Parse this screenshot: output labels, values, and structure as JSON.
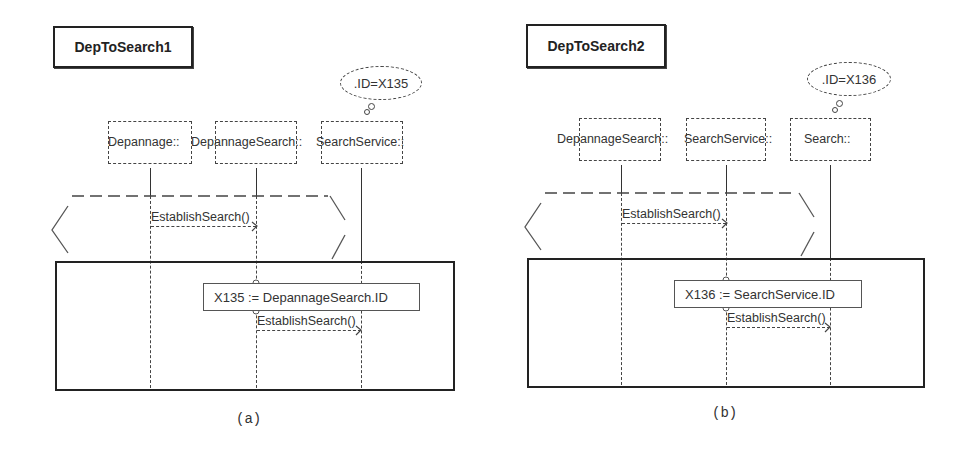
{
  "panels": [
    {
      "id": "a",
      "title": "DepToSearch1",
      "thought": ".ID=X135",
      "lifelines": [
        {
          "label": "Depannage::"
        },
        {
          "label": "DepannageSearch::"
        },
        {
          "label": "SearchService::"
        }
      ],
      "loop_message": "EstablishSearch()",
      "note": "X135 := DepannageSearch.ID",
      "inner_message": "EstablishSearch()",
      "caption": "(a)"
    },
    {
      "id": "b",
      "title": "DepToSearch2",
      "thought": ".ID=X136",
      "lifelines": [
        {
          "label": "DepannageSearch::"
        },
        {
          "label": "SearchService::"
        },
        {
          "label": "Search::"
        }
      ],
      "loop_message": "EstablishSearch()",
      "note": "X136 := SearchService.ID",
      "inner_message": "EstablishSearch()",
      "caption": "(b)"
    }
  ]
}
